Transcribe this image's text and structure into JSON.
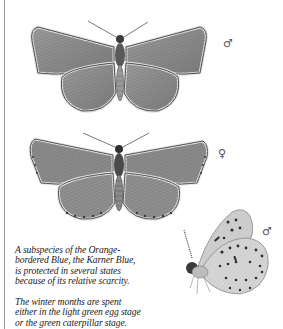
{
  "plate": {
    "title": "Karner Blue",
    "specimens": [
      {
        "id": "male-upperside",
        "sex_symbol": "♂",
        "sex": "male",
        "view": "upperside"
      },
      {
        "id": "female-upperside",
        "sex_symbol": "♀",
        "sex": "female",
        "view": "upperside"
      },
      {
        "id": "male-underside",
        "sex_symbol": "♂",
        "sex": "male",
        "view": "underside"
      }
    ],
    "captions": [
      {
        "lines": [
          "A subspecies of the Orange-",
          "bordered Blue, the Karner Blue,",
          "is protected in several states",
          "because of its relative scarcity."
        ]
      },
      {
        "lines": [
          "The winter months are spent",
          "either in the light green egg stage",
          "or the green caterpillar stage."
        ]
      }
    ]
  },
  "colors": {
    "background": "#ffffff",
    "wing_fill": "#8c8c8c",
    "wing_dark": "#4a4a4a",
    "fringe": "#d8d8d8",
    "text": "#222222",
    "rule": "#9a9a9a"
  }
}
